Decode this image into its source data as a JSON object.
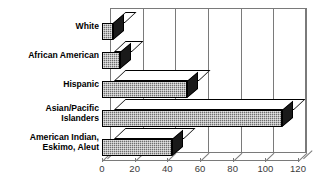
{
  "chart_data": {
    "type": "bar",
    "orientation": "horizontal",
    "title": "",
    "xlabel": "",
    "ylabel": "",
    "xlim": [
      0,
      120
    ],
    "xticks": [
      0,
      20,
      40,
      60,
      80,
      100,
      120
    ],
    "grid": true,
    "legend": false,
    "style": "3d-bars",
    "categories": [
      "White",
      "African American",
      "Hispanic",
      "Asian/Pacific\nIslanders",
      "American Indian,\nEskimo, Aleut"
    ],
    "values": [
      7,
      11,
      52,
      110,
      43
    ],
    "colors": {
      "bar_face": "#6e6e6e",
      "bar_side": "#1a1a1a",
      "bar_top": "#ffffff",
      "axis": "#7a7a7a",
      "text": "#000000",
      "background": "#ffffff"
    }
  }
}
